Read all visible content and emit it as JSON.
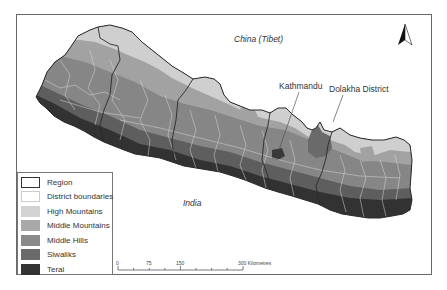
{
  "map": {
    "title": "",
    "labels": {
      "china": "China (Tibet)",
      "india": "India",
      "kathmandu": "Kathmandu",
      "dolakha": "Dolakha District"
    },
    "north_arrow": "north-arrow"
  },
  "legend": {
    "items": [
      {
        "label": "Region",
        "color": "#ffffff",
        "border": "#333333"
      },
      {
        "label": "District boundaries",
        "color": "#ffffff",
        "border": "#cccccc"
      },
      {
        "label": "High Mountains",
        "color": "#d2d2d2",
        "border": "#d2d2d2"
      },
      {
        "label": "Middle Mountains",
        "color": "#a9a9a9",
        "border": "#a9a9a9"
      },
      {
        "label": "Middle Hills",
        "color": "#8a8a8a",
        "border": "#8a8a8a"
      },
      {
        "label": "Siwaliks",
        "color": "#6a6a6a",
        "border": "#6a6a6a"
      },
      {
        "label": "Terai",
        "color": "#333333",
        "border": "#333333"
      }
    ]
  },
  "scale_bar": {
    "ticks": [
      "0",
      "75",
      "150",
      "300 Kilometres"
    ]
  }
}
